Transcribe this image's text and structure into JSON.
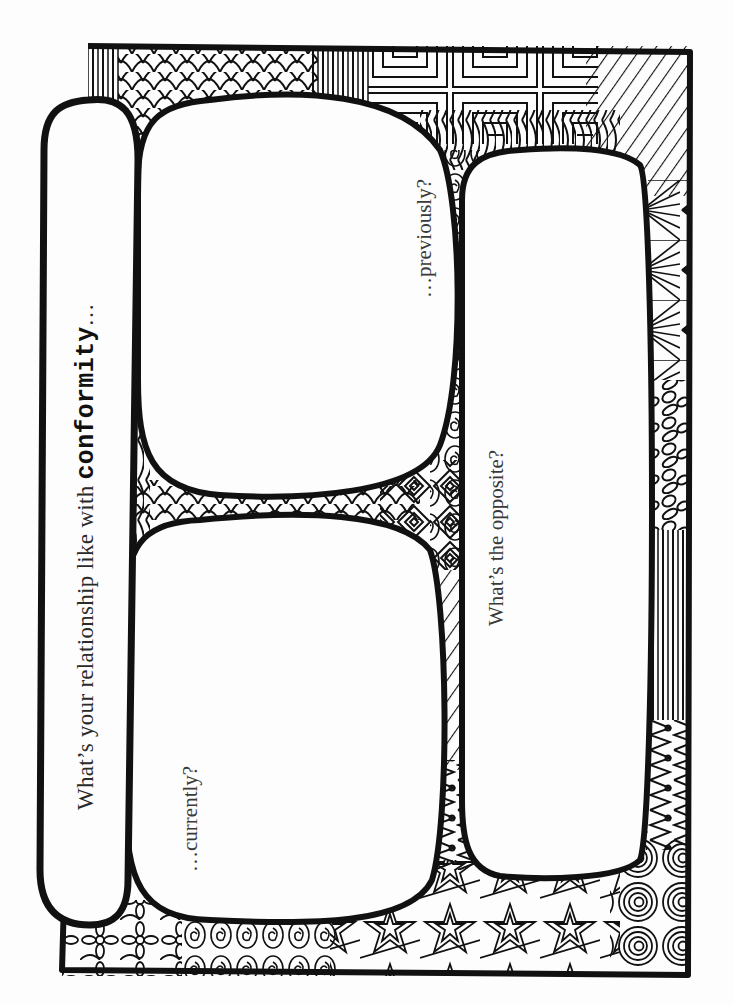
{
  "worksheet": {
    "title_prefix": "What’s your relationship like with ",
    "title_keyword": "conformity",
    "title_suffix": "…",
    "prompts": {
      "previously": "…previously?",
      "currently": "…currently?",
      "opposite": "What’s the opposite?"
    }
  },
  "colors": {
    "ink": "#111111",
    "paper": "#fdfdfd",
    "text": "#2a2a2a"
  },
  "decor": {
    "border_style": "zentangle-doodle-frame",
    "patterns": [
      "vertical-lines",
      "scales",
      "nested-squares",
      "curved-stripes",
      "diagonal-lines",
      "fan-rays",
      "pebbles",
      "spirals",
      "stars",
      "flowers",
      "diamonds",
      "triangles"
    ]
  }
}
